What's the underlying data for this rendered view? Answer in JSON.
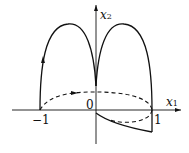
{
  "figure": {
    "axis_labels": {
      "x": "x",
      "x_sub": "1",
      "y": "x",
      "y_sub": "2"
    },
    "ticks": {
      "origin": "0",
      "neg_one": "−1",
      "pos_one": "1"
    },
    "colors": {
      "stroke": "#111111",
      "background": "#ffffff"
    },
    "curves": [
      {
        "name": "solid-trajectory",
        "style": "solid",
        "description": "Starts at (-1,0), rises in an arch to origin, second arch to (1,0), then dips below x-axis back to origin"
      },
      {
        "name": "dashed-trajectory",
        "style": "dashed",
        "description": "Ellipse-like loop from (-1,0) through positive x2 to (1,0) and back below axis"
      }
    ]
  }
}
